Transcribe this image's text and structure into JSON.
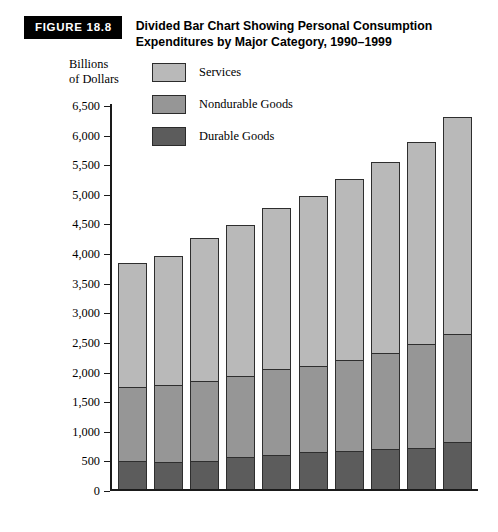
{
  "header": {
    "badge": "FIGURE 18.8",
    "title_line1": "Divided Bar Chart Showing Personal Consumption",
    "title_line2": "Expenditures by Major Category, 1990–1999"
  },
  "axis_title": {
    "line1": "Billions",
    "line2": "of Dollars"
  },
  "colors": {
    "services": "#b9b9b9",
    "nondurable": "#969696",
    "durable": "#5c5c5c",
    "outline": "#2e2e2e",
    "axis": "#1a1a1a",
    "badge_bg": "#000000",
    "badge_text": "#ffffff"
  },
  "legend": {
    "items": [
      {
        "label": "Services",
        "color_key": "services"
      },
      {
        "label": "Nondurable Goods",
        "color_key": "nondurable"
      },
      {
        "label": "Durable Goods",
        "color_key": "durable"
      }
    ]
  },
  "chart_data": {
    "type": "bar",
    "subtype": "stacked",
    "title": "Divided Bar Chart Showing Personal Consumption Expenditures by Major Category, 1990–1999",
    "xlabel": "",
    "ylabel": "Billions of Dollars",
    "ylim": [
      0,
      6500
    ],
    "ytick_step": 500,
    "grid": false,
    "legend_position": "top-left-inside",
    "categories": [
      "1990",
      "1991",
      "1992",
      "1993",
      "1994",
      "1995",
      "1996",
      "1997",
      "1998",
      "1999"
    ],
    "ytick_labels": [
      "0",
      "500",
      "1,000",
      "1,500",
      "2,000",
      "2,500",
      "3,000",
      "3,500",
      "4,000",
      "4,500",
      "5,000",
      "5,500",
      "6,000",
      "6,500"
    ],
    "ytick_values": [
      0,
      500,
      1000,
      1500,
      2000,
      2500,
      3000,
      3500,
      4000,
      4500,
      5000,
      5500,
      6000,
      6500
    ],
    "series": [
      {
        "name": "Durable Goods",
        "color_key": "durable",
        "values": [
          470,
          450,
          480,
          540,
          580,
          630,
          640,
          670,
          700,
          790
        ]
      },
      {
        "name": "Nondurable Goods",
        "color_key": "nondurable",
        "values": [
          1250,
          1310,
          1350,
          1360,
          1440,
          1450,
          1530,
          1620,
          1750,
          1830
        ]
      },
      {
        "name": "Services",
        "color_key": "services",
        "values": [
          2100,
          2180,
          2410,
          2550,
          2720,
          2870,
          3070,
          3230,
          3410,
          3660
        ]
      }
    ],
    "cumulative_boundaries": [
      {
        "category": "1990",
        "durable_top": 470,
        "nondurable_top": 1720,
        "total": 3820
      },
      {
        "category": "1991",
        "durable_top": 450,
        "nondurable_top": 1760,
        "total": 3940
      },
      {
        "category": "1992",
        "durable_top": 480,
        "nondurable_top": 1830,
        "total": 4240
      },
      {
        "category": "1993",
        "durable_top": 540,
        "nondurable_top": 1900,
        "total": 4450
      },
      {
        "category": "1994",
        "durable_top": 580,
        "nondurable_top": 2020,
        "total": 4740
      },
      {
        "category": "1995",
        "durable_top": 630,
        "nondurable_top": 2080,
        "total": 4950
      },
      {
        "category": "1996",
        "durable_top": 640,
        "nondurable_top": 2170,
        "total": 5240
      },
      {
        "category": "1997",
        "durable_top": 670,
        "nondurable_top": 2290,
        "total": 5520
      },
      {
        "category": "1998",
        "durable_top": 700,
        "nondurable_top": 2450,
        "total": 5860
      },
      {
        "category": "1999",
        "durable_top": 790,
        "nondurable_top": 2620,
        "total": 6280
      }
    ]
  }
}
